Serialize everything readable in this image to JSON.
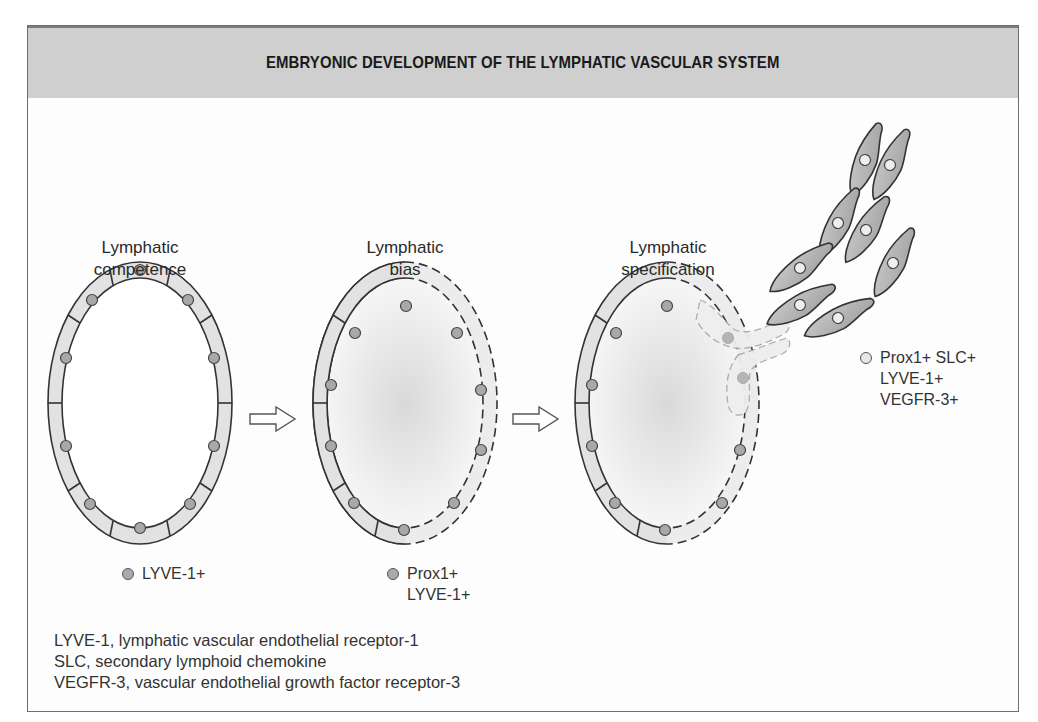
{
  "header": {
    "title": "EMBRYONIC DEVELOPMENT OF THE LYMPHATIC VASCULAR SYSTEM"
  },
  "stages": [
    {
      "label_line1": "Lymphatic",
      "label_line2": "competence",
      "legend": {
        "marker": "filled-gray-dot",
        "lines": [
          "LYVE-1+"
        ]
      }
    },
    {
      "label_line1": "Lymphatic",
      "label_line2": "bias",
      "legend": {
        "marker": "filled-gray-dot",
        "lines": [
          "Prox1+",
          "LYVE-1+"
        ]
      }
    },
    {
      "label_line1": "Lymphatic",
      "label_line2": "specification",
      "legend": {
        "marker": "light-dot",
        "lines": [
          "Prox1+ SLC+",
          "LYVE-1+",
          "VEGFR-3+"
        ]
      }
    }
  ],
  "arrows": [
    {
      "from": "Lymphatic competence",
      "to": "Lymphatic bias",
      "icon": "hollow-right-arrow"
    },
    {
      "from": "Lymphatic bias",
      "to": "Lymphatic specification",
      "icon": "hollow-right-arrow"
    }
  ],
  "footnotes": [
    "LYVE-1, lymphatic vascular endothelial receptor-1",
    "SLC, secondary lymphoid chemokine",
    "VEGFR-3, vascular endothelial growth factor receptor-3"
  ],
  "colors": {
    "header_bg": "#cfcfcf",
    "cell_fill": "#e2e2e2",
    "nucleus_fill": "#a8a8a8",
    "outline": "#333333",
    "migrating_cell_fill": "#b8b8b8"
  }
}
